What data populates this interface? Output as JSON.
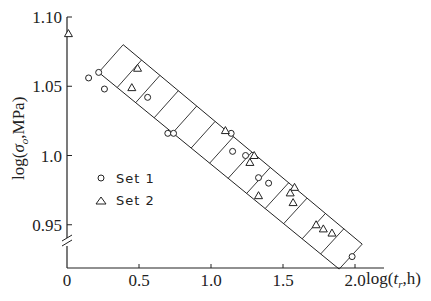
{
  "chart_data": {
    "type": "scatter",
    "title": "",
    "xlabel": "log(t_r,h)",
    "ylabel": "log(σ_o,MPa)",
    "xlim": [
      0,
      2.1
    ],
    "ylim": [
      0.925,
      1.1
    ],
    "x_ticks": [
      {
        "value": 0,
        "label": "0"
      },
      {
        "value": 0.5,
        "label": "0.5"
      },
      {
        "value": 1.0,
        "label": "1.0"
      },
      {
        "value": 1.5,
        "label": "1.5"
      },
      {
        "value": 2.0,
        "label": "2.0"
      }
    ],
    "y_ticks": [
      {
        "value": 0.95,
        "label": "0.95"
      },
      {
        "value": 1.0,
        "label": "1.0"
      },
      {
        "value": 1.05,
        "label": "1.05"
      },
      {
        "value": 1.1,
        "label": "1.10"
      }
    ],
    "y_axis_break": true,
    "grid": false,
    "legend_position": "center-left",
    "series": [
      {
        "name": "Set 1",
        "marker": "circle",
        "points": [
          [
            0.15,
            1.056
          ],
          [
            0.22,
            1.06
          ],
          [
            0.26,
            1.048
          ],
          [
            0.56,
            1.042
          ],
          [
            0.7,
            1.016
          ],
          [
            0.74,
            1.016
          ],
          [
            1.14,
            1.016
          ],
          [
            1.15,
            1.003
          ],
          [
            1.24,
            1.0
          ],
          [
            1.33,
            0.984
          ],
          [
            1.4,
            0.98
          ],
          [
            1.98,
            0.927
          ]
        ]
      },
      {
        "name": "Set 2",
        "marker": "triangle",
        "points": [
          [
            0.01,
            1.088
          ],
          [
            0.49,
            1.063
          ],
          [
            0.45,
            1.049
          ],
          [
            1.1,
            1.018
          ],
          [
            1.3,
            1.0
          ],
          [
            1.27,
            0.995
          ],
          [
            1.33,
            0.971
          ],
          [
            1.58,
            0.977
          ],
          [
            1.55,
            0.973
          ],
          [
            1.57,
            0.966
          ],
          [
            1.73,
            0.95
          ],
          [
            1.78,
            0.947
          ],
          [
            1.84,
            0.944
          ]
        ]
      }
    ],
    "annotations": [
      {
        "type": "hatched-band",
        "description": "Linear scatter band between two parallel lines",
        "upper_line": [
          [
            0.39,
            1.08
          ],
          [
            2.05,
            0.936
          ]
        ],
        "lower_line": [
          [
            0.22,
            1.06
          ],
          [
            1.89,
            0.918
          ]
        ]
      }
    ]
  },
  "legend": {
    "set1": "Set 1",
    "set2": "Set 2"
  },
  "axes": {
    "xlabel_main": "log(",
    "xlabel_var": "t",
    "xlabel_sub": "r",
    "xlabel_rest": ",h)",
    "ylabel_main": "log(",
    "ylabel_var": "σ",
    "ylabel_sub": "o",
    "ylabel_rest": ",MPa)"
  },
  "colors": {
    "ink": "#222222",
    "background": "#ffffff"
  }
}
